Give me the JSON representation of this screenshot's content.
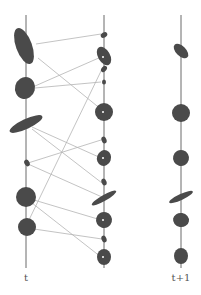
{
  "diagram": {
    "type": "ellipse-correspondence",
    "labels": {
      "left": "t",
      "right": "t+1"
    },
    "colors": {
      "ellipse_fill": "#4a4a4a",
      "axis": "#6a6a6a",
      "edge": "#b4b4b4"
    },
    "axes": [
      {
        "x": 26,
        "y1": 15,
        "y2": 268
      },
      {
        "x": 104,
        "y1": 15,
        "y2": 268
      },
      {
        "x": 181,
        "y1": 15,
        "y2": 268
      }
    ],
    "left_ellipses": [
      {
        "cx": 24,
        "cy": 46,
        "rx": 8,
        "ry": 19,
        "rot": -20
      },
      {
        "cx": 25,
        "cy": 88,
        "rx": 10,
        "ry": 11,
        "rot": 15
      },
      {
        "cx": 26,
        "cy": 124,
        "rx": 18,
        "ry": 5,
        "rot": -25
      },
      {
        "cx": 27,
        "cy": 163,
        "rx": 2.5,
        "ry": 3.5,
        "rot": -30
      },
      {
        "cx": 26,
        "cy": 197,
        "rx": 10,
        "ry": 10,
        "rot": 0
      },
      {
        "cx": 27,
        "cy": 227,
        "rx": 9,
        "ry": 9,
        "rot": 0
      }
    ],
    "middle_ellipses": [
      {
        "cx": 104,
        "cy": 35,
        "rx": 3.5,
        "ry": 2.5,
        "rot": -30
      },
      {
        "cx": 104,
        "cy": 56,
        "rx": 6,
        "ry": 10,
        "rot": -30
      },
      {
        "cx": 104,
        "cy": 69,
        "rx": 2.5,
        "ry": 3.5,
        "rot": 40
      },
      {
        "cx": 104,
        "cy": 82,
        "rx": 2,
        "ry": 2.5,
        "rot": 0
      },
      {
        "cx": 104,
        "cy": 112,
        "rx": 9,
        "ry": 9,
        "rot": 0
      },
      {
        "cx": 104,
        "cy": 140,
        "rx": 2.5,
        "ry": 3.5,
        "rot": -20
      },
      {
        "cx": 104,
        "cy": 158,
        "rx": 7,
        "ry": 8,
        "rot": 20
      },
      {
        "cx": 104,
        "cy": 182,
        "rx": 2.5,
        "ry": 3.5,
        "rot": -20
      },
      {
        "cx": 104,
        "cy": 198,
        "rx": 14,
        "ry": 3,
        "rot": -30
      },
      {
        "cx": 104,
        "cy": 220,
        "rx": 8,
        "ry": 8,
        "rot": 15
      },
      {
        "cx": 104,
        "cy": 239,
        "rx": 2.5,
        "ry": 3.5,
        "rot": -20
      },
      {
        "cx": 104,
        "cy": 257,
        "rx": 7,
        "ry": 8,
        "rot": 0
      }
    ],
    "right_ellipses": [
      {
        "cx": 181,
        "cy": 51,
        "rx": 5,
        "ry": 9,
        "rot": -45
      },
      {
        "cx": 181,
        "cy": 113,
        "rx": 9,
        "ry": 9,
        "rot": 0
      },
      {
        "cx": 181,
        "cy": 158,
        "rx": 8,
        "ry": 8,
        "rot": 15
      },
      {
        "cx": 181,
        "cy": 197,
        "rx": 13,
        "ry": 3,
        "rot": -25
      },
      {
        "cx": 181,
        "cy": 220,
        "rx": 8,
        "ry": 7,
        "rot": 10
      },
      {
        "cx": 181,
        "cy": 256,
        "rx": 7,
        "ry": 8,
        "rot": 0
      }
    ],
    "edges": [
      {
        "from": [
          36,
          44
        ],
        "to": [
          101,
          34
        ]
      },
      {
        "from": [
          38,
          58
        ],
        "to": [
          102,
          110
        ]
      },
      {
        "from": [
          35,
          86
        ],
        "to": [
          101,
          57
        ]
      },
      {
        "from": [
          35,
          88
        ],
        "to": [
          101,
          82
        ]
      },
      {
        "from": [
          32,
          127
        ],
        "to": [
          101,
          158
        ]
      },
      {
        "from": [
          32,
          129
        ],
        "to": [
          102,
          183
        ]
      },
      {
        "from": [
          28,
          163
        ],
        "to": [
          101,
          140
        ]
      },
      {
        "from": [
          28,
          164
        ],
        "to": [
          102,
          197
        ]
      },
      {
        "from": [
          34,
          200
        ],
        "to": [
          101,
          220
        ]
      },
      {
        "from": [
          32,
          203
        ],
        "to": [
          101,
          257
        ]
      },
      {
        "from": [
          34,
          229
        ],
        "to": [
          102,
          239
        ]
      },
      {
        "from": [
          28,
          222
        ],
        "to": [
          102,
          69
        ]
      }
    ],
    "center_dots": [
      [
        103,
        57
      ],
      [
        103,
        112
      ],
      [
        103,
        158
      ],
      [
        103,
        220
      ],
      [
        103,
        257
      ]
    ]
  }
}
